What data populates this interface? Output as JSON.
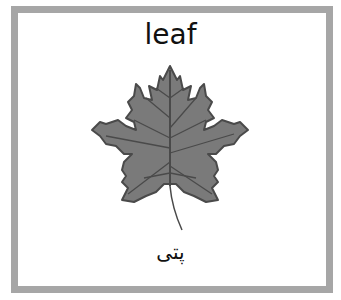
{
  "card": {
    "english_word": "leaf",
    "urdu_word": "پتی",
    "image": "maple-leaf-illustration",
    "colors": {
      "frame": "#a6a6a6",
      "leaf_fill": "#7a7a7a",
      "leaf_outline": "#4d4d4d"
    }
  }
}
